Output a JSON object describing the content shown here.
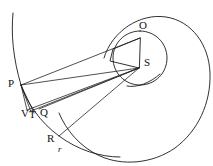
{
  "figure": {
    "kind": "geometry-diagram",
    "background_color": "#ffffff",
    "stroke_color": "#1a1a1a",
    "labels": [
      {
        "id": "label-P",
        "text": "P",
        "x": 8,
        "y": 83,
        "italic": false
      },
      {
        "id": "label-O",
        "text": "O",
        "x": 139,
        "y": 25,
        "italic": false
      },
      {
        "id": "label-S",
        "text": "S",
        "x": 144,
        "y": 62,
        "italic": false
      },
      {
        "id": "label-V",
        "text": "V",
        "x": 22,
        "y": 113,
        "italic": false
      },
      {
        "id": "label-T",
        "text": "T",
        "x": 30,
        "y": 114,
        "italic": false
      },
      {
        "id": "label-Q",
        "text": "Q",
        "x": 41,
        "y": 112,
        "italic": false
      },
      {
        "id": "label-R",
        "text": "R",
        "x": 48,
        "y": 138,
        "italic": false
      },
      {
        "id": "label-r",
        "text": "r",
        "x": 58,
        "y": 149,
        "italic": true
      }
    ],
    "points": {
      "P": {
        "x": 21,
        "y": 85
      },
      "O": {
        "x": 140,
        "y": 38
      },
      "S": {
        "x": 139,
        "y": 68
      },
      "V": {
        "x": 27,
        "y": 108
      },
      "T": {
        "x": 33,
        "y": 110
      },
      "Q": {
        "x": 38,
        "y": 108
      },
      "R": {
        "x": 59,
        "y": 136
      }
    },
    "shapes": {
      "outer_spiral": "large spiral / oval curve enclosing the figure",
      "inner_circle": "circle through O and S region",
      "quadrilateral": "P-area quad with corners near O and S",
      "upper_arc": "arc descending from top-left to P",
      "small_arc_near_S": "short arc below and right of S",
      "chords": [
        "P-S",
        "V-S",
        "T-S",
        "Q-S",
        "R-S",
        "P-O"
      ]
    }
  }
}
